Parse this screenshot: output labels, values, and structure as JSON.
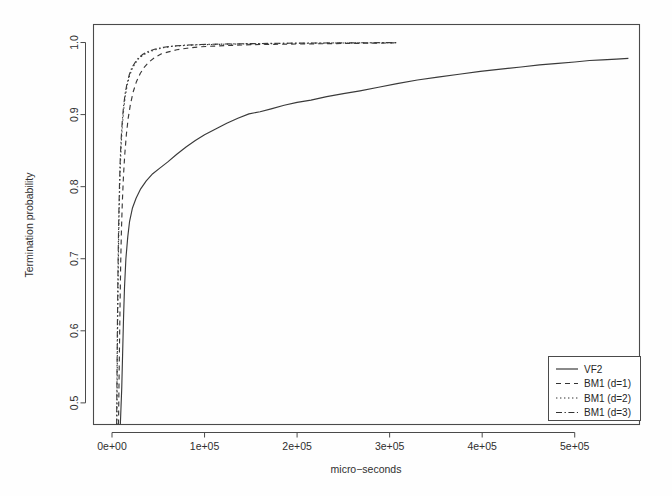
{
  "chart_data": {
    "type": "line",
    "title": "",
    "xlabel": "micro−seconds",
    "ylabel": "Termination probability",
    "xlim": [
      -20000,
      570000
    ],
    "ylim": [
      0.47,
      1.025
    ],
    "grid": false,
    "legend_position": "bottom-right",
    "xticks": [
      0,
      100000,
      200000,
      300000,
      400000,
      500000
    ],
    "xticklabels": [
      "0e+00",
      "1e+05",
      "2e+05",
      "3e+05",
      "4e+05",
      "5e+05"
    ],
    "yticks": [
      0.5,
      0.6,
      0.7,
      0.8,
      0.9,
      1.0
    ],
    "yticklabels": [
      "0.5",
      "0.6",
      "0.7",
      "0.8",
      "0.9",
      "1.0"
    ],
    "series": [
      {
        "name": "VF2",
        "style": "solid",
        "dash": "none",
        "points": [
          [
            9000,
            0.47
          ],
          [
            10500,
            0.52
          ],
          [
            11500,
            0.57
          ],
          [
            12500,
            0.62
          ],
          [
            13500,
            0.66
          ],
          [
            15000,
            0.7
          ],
          [
            17000,
            0.73
          ],
          [
            19000,
            0.752
          ],
          [
            22000,
            0.77
          ],
          [
            26000,
            0.784
          ],
          [
            31000,
            0.797
          ],
          [
            37000,
            0.808
          ],
          [
            44000,
            0.818
          ],
          [
            52000,
            0.826
          ],
          [
            60000,
            0.834
          ],
          [
            70000,
            0.845
          ],
          [
            80000,
            0.855
          ],
          [
            90000,
            0.864
          ],
          [
            100000,
            0.872
          ],
          [
            112000,
            0.88
          ],
          [
            124000,
            0.888
          ],
          [
            136000,
            0.895
          ],
          [
            148000,
            0.901
          ],
          [
            160000,
            0.904
          ],
          [
            172000,
            0.908
          ],
          [
            186000,
            0.913
          ],
          [
            200000,
            0.917
          ],
          [
            215000,
            0.92
          ],
          [
            232000,
            0.925
          ],
          [
            250000,
            0.929
          ],
          [
            268000,
            0.933
          ],
          [
            288000,
            0.938
          ],
          [
            308000,
            0.943
          ],
          [
            330000,
            0.948
          ],
          [
            352000,
            0.952
          ],
          [
            375000,
            0.956
          ],
          [
            398000,
            0.96
          ],
          [
            420000,
            0.963
          ],
          [
            442000,
            0.966
          ],
          [
            462000,
            0.969
          ],
          [
            482000,
            0.971
          ],
          [
            500000,
            0.973
          ],
          [
            516000,
            0.975
          ],
          [
            530000,
            0.976
          ],
          [
            545000,
            0.977
          ],
          [
            558000,
            0.978
          ]
        ]
      },
      {
        "name": "BM1 (d=1)",
        "style": "dashed",
        "dash": "5,4",
        "points": [
          [
            7000,
            0.47
          ],
          [
            7600,
            0.53
          ],
          [
            8200,
            0.59
          ],
          [
            8800,
            0.645
          ],
          [
            9400,
            0.695
          ],
          [
            10200,
            0.74
          ],
          [
            11200,
            0.78
          ],
          [
            12400,
            0.815
          ],
          [
            13800,
            0.845
          ],
          [
            15500,
            0.872
          ],
          [
            17500,
            0.895
          ],
          [
            20000,
            0.915
          ],
          [
            23000,
            0.932
          ],
          [
            26500,
            0.946
          ],
          [
            30500,
            0.957
          ],
          [
            35000,
            0.966
          ],
          [
            40000,
            0.973
          ],
          [
            46000,
            0.979
          ],
          [
            53000,
            0.984
          ],
          [
            61000,
            0.987
          ],
          [
            70000,
            0.99
          ],
          [
            81000,
            0.992
          ],
          [
            94000,
            0.994
          ],
          [
            110000,
            0.995
          ],
          [
            128000,
            0.996
          ],
          [
            150000,
            0.997
          ],
          [
            175000,
            0.9975
          ],
          [
            205000,
            0.998
          ],
          [
            240000,
            0.9985
          ],
          [
            275000,
            0.999
          ],
          [
            305000,
            0.9995
          ]
        ]
      },
      {
        "name": "BM1 (d=2)",
        "style": "dotted",
        "dash": "1.4,2.6",
        "points": [
          [
            5200,
            0.47
          ],
          [
            5600,
            0.535
          ],
          [
            6000,
            0.6
          ],
          [
            6500,
            0.66
          ],
          [
            7000,
            0.712
          ],
          [
            7600,
            0.758
          ],
          [
            8300,
            0.798
          ],
          [
            9100,
            0.833
          ],
          [
            10100,
            0.862
          ],
          [
            11300,
            0.887
          ],
          [
            12700,
            0.908
          ],
          [
            14400,
            0.926
          ],
          [
            16400,
            0.941
          ],
          [
            18800,
            0.953
          ],
          [
            21600,
            0.963
          ],
          [
            25000,
            0.971
          ],
          [
            29000,
            0.978
          ],
          [
            34000,
            0.983
          ],
          [
            40000,
            0.987
          ],
          [
            47000,
            0.99
          ],
          [
            56000,
            0.993
          ],
          [
            67000,
            0.995
          ],
          [
            80000,
            0.996
          ],
          [
            96000,
            0.997
          ],
          [
            116000,
            0.9975
          ],
          [
            140000,
            0.998
          ],
          [
            170000,
            0.9985
          ],
          [
            205000,
            0.999
          ],
          [
            245000,
            0.9993
          ],
          [
            280000,
            0.9996
          ],
          [
            308000,
            0.9998
          ]
        ]
      },
      {
        "name": "BM1 (d=3)",
        "style": "dashdot",
        "dash": "6,2.5,1.4,2.5",
        "points": [
          [
            5000,
            0.47
          ],
          [
            5400,
            0.54
          ],
          [
            5800,
            0.605
          ],
          [
            6300,
            0.665
          ],
          [
            6800,
            0.718
          ],
          [
            7400,
            0.763
          ],
          [
            8100,
            0.803
          ],
          [
            8900,
            0.838
          ],
          [
            9900,
            0.866
          ],
          [
            11100,
            0.891
          ],
          [
            12500,
            0.912
          ],
          [
            14200,
            0.929
          ],
          [
            16200,
            0.943
          ],
          [
            18600,
            0.955
          ],
          [
            21400,
            0.965
          ],
          [
            24800,
            0.972
          ],
          [
            28800,
            0.979
          ],
          [
            33800,
            0.984
          ],
          [
            39800,
            0.988
          ],
          [
            46800,
            0.991
          ],
          [
            55800,
            0.9935
          ],
          [
            66800,
            0.9952
          ],
          [
            79800,
            0.9964
          ],
          [
            95800,
            0.9972
          ],
          [
            115800,
            0.9978
          ],
          [
            139800,
            0.9983
          ],
          [
            169800,
            0.9988
          ],
          [
            204800,
            0.9992
          ],
          [
            244800,
            0.9995
          ],
          [
            279800,
            0.9997
          ],
          [
            308000,
            0.9999
          ]
        ]
      }
    ],
    "legend": [
      {
        "label": "VF2",
        "style": "solid"
      },
      {
        "label": "BM1 (d=1)",
        "style": "dashed"
      },
      {
        "label": "BM1 (d=2)",
        "style": "dotted"
      },
      {
        "label": "BM1 (d=3)",
        "style": "dashdot"
      }
    ]
  }
}
